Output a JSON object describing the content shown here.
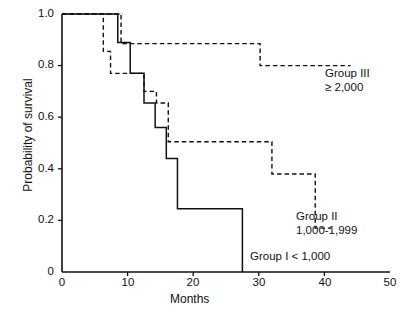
{
  "chart_data": {
    "type": "line",
    "title": "",
    "subtitle": "",
    "xlabel": "Months",
    "ylabel": "Probability of survival",
    "xlim": [
      0,
      50
    ],
    "ylim": [
      0,
      1.0
    ],
    "xticks": [
      "0",
      "10",
      "20",
      "30",
      "40",
      "50"
    ],
    "xtick_values": [
      0,
      10,
      20,
      30,
      40,
      50
    ],
    "yticks": [
      "0",
      "0.2",
      "0.4",
      "0.6",
      "0.8",
      "1.0"
    ],
    "ytick_values": [
      0,
      0.2,
      0.4,
      0.6,
      0.8,
      1.0
    ],
    "grid": false,
    "legend_position": "inline-annotations",
    "series": [
      {
        "name": "Group I < 1,000",
        "style": "solid",
        "color": "#111111",
        "points": [
          [
            0,
            1.0
          ],
          [
            8.5,
            1.0
          ],
          [
            8.5,
            0.89
          ],
          [
            10.4,
            0.89
          ],
          [
            10.4,
            0.77
          ],
          [
            12.5,
            0.77
          ],
          [
            12.5,
            0.655
          ],
          [
            14.2,
            0.655
          ],
          [
            14.2,
            0.56
          ],
          [
            15.9,
            0.56
          ],
          [
            15.9,
            0.44
          ],
          [
            17.6,
            0.44
          ],
          [
            17.6,
            0.245
          ],
          [
            27.5,
            0.245
          ],
          [
            27.5,
            0.085
          ],
          [
            27.5,
            0.0
          ]
        ]
      },
      {
        "name": "Group II 1,000-1,999",
        "style": "dashed",
        "color": "#111111",
        "points": [
          [
            0,
            1.0
          ],
          [
            6.3,
            1.0
          ],
          [
            6.3,
            0.855
          ],
          [
            7.4,
            0.855
          ],
          [
            7.4,
            0.77
          ],
          [
            12.5,
            0.77
          ],
          [
            12.5,
            0.7
          ],
          [
            14.4,
            0.7
          ],
          [
            14.4,
            0.655
          ],
          [
            16.2,
            0.655
          ],
          [
            16.2,
            0.505
          ],
          [
            32.0,
            0.505
          ],
          [
            32.0,
            0.38
          ],
          [
            38.6,
            0.38
          ],
          [
            38.6,
            0.17
          ],
          [
            41.0,
            0.17
          ]
        ]
      },
      {
        "name": "Group III ≥ 2,000",
        "style": "dashed",
        "color": "#111111",
        "points": [
          [
            0,
            1.0
          ],
          [
            9.0,
            1.0
          ],
          [
            9.0,
            0.885
          ],
          [
            30.2,
            0.885
          ],
          [
            30.2,
            0.8
          ],
          [
            44.0,
            0.8
          ]
        ]
      }
    ],
    "annotations": [
      {
        "id": "group3",
        "line1": "Group III",
        "line2": "≥ 2,000"
      },
      {
        "id": "group2",
        "line1": "Group II",
        "line2": "1,000-1,999"
      },
      {
        "id": "group1",
        "line1": "Group I < 1,000",
        "line2": ""
      }
    ]
  },
  "axes": {
    "y_title": "Probability of survival",
    "x_title": "Months"
  },
  "colors": {
    "axis": "#111111",
    "line": "#111111",
    "background": "#ffffff"
  }
}
